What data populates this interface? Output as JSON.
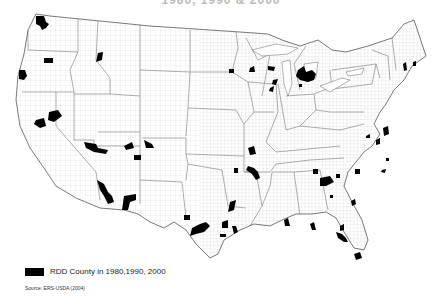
{
  "title": "1980, 1990 & 2000",
  "legend": {
    "swatch_color": "#000000",
    "label": "RDD County in 1980,1990, 2000"
  },
  "source": "Source: ERS-USDA (2004)",
  "colors": {
    "rdd_county": "#000000",
    "state_border": "#888888",
    "county_border": "#d8d8d8",
    "background": "#ffffff"
  },
  "map": {
    "type": "choropleth",
    "region": "Contiguous United States (county level)",
    "highlighted_category": "RDD County in 1980,1990, 2000",
    "highlighted_regions_approx": [
      "NW Washington",
      "central Oregon",
      "SW Oregon coast",
      "N Idaho",
      "N California (Sacramento area)",
      "central California",
      "SE Nevada / N Arizona",
      "E Utah",
      "SW Colorado",
      "central Arizona",
      "SE Arizona",
      "NW New Mexico",
      "central Minnesota",
      "N Wisconsin",
      "N Michigan",
      "Maine",
      "E Virginia",
      "N Carolina",
      "Georgia",
      "Florida",
      "Alabama",
      "Arkansas",
      "Oklahoma",
      "Texas",
      "Missouri"
    ]
  }
}
